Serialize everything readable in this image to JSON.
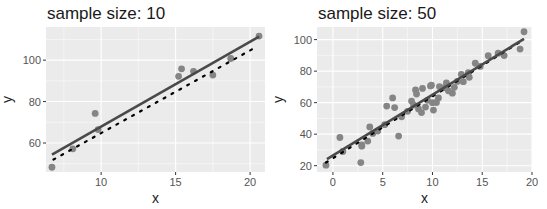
{
  "chart_data": [
    {
      "type": "scatter",
      "title": "sample size: 10",
      "xlabel": "x",
      "ylabel": "y",
      "xlim": [
        6.3,
        21.0
      ],
      "ylim": [
        46,
        116
      ],
      "xticks": [
        10,
        15,
        20
      ],
      "yticks": [
        60,
        80,
        100
      ],
      "grid": true,
      "panel": {
        "x0": 46,
        "x1": 265,
        "y0": 27,
        "y1": 172
      },
      "points": [
        {
          "x": 6.7,
          "y": 48.3
        },
        {
          "x": 8.1,
          "y": 57.2
        },
        {
          "x": 9.6,
          "y": 74.3
        },
        {
          "x": 9.8,
          "y": 66.5
        },
        {
          "x": 15.2,
          "y": 92.2
        },
        {
          "x": 15.4,
          "y": 95.8
        },
        {
          "x": 16.2,
          "y": 94.6
        },
        {
          "x": 17.5,
          "y": 92.8
        },
        {
          "x": 18.7,
          "y": 100.8
        },
        {
          "x": 20.6,
          "y": 111.6
        }
      ],
      "fit_line": {
        "x": [
          6.7,
          20.6
        ],
        "y": [
          54.4,
          111.4
        ]
      },
      "true_line": {
        "x": [
          6.8,
          20.2
        ],
        "y": [
          52.0,
          105.5
        ]
      }
    },
    {
      "type": "scatter",
      "title": "sample size: 50",
      "xlabel": "x",
      "ylabel": "y",
      "xlim": [
        -1.6,
        20.0
      ],
      "ylim": [
        16,
        108
      ],
      "xticks": [
        0,
        5,
        10,
        15,
        20
      ],
      "yticks": [
        20,
        40,
        60,
        80,
        100
      ],
      "grid": true,
      "panel": {
        "x0": 317,
        "x1": 532,
        "y0": 27,
        "y1": 172
      },
      "points": [
        {
          "x": -0.7,
          "y": 20.3
        },
        {
          "x": 0.7,
          "y": 37.9
        },
        {
          "x": 2.8,
          "y": 22.0
        },
        {
          "x": 2.9,
          "y": 33.2
        },
        {
          "x": 2.9,
          "y": 32.4
        },
        {
          "x": 3.5,
          "y": 35.6
        },
        {
          "x": 3.7,
          "y": 44.6
        },
        {
          "x": 4.5,
          "y": 42.0
        },
        {
          "x": 5.4,
          "y": 57.8
        },
        {
          "x": 5.2,
          "y": 46.0
        },
        {
          "x": 6.0,
          "y": 63.0
        },
        {
          "x": 6.2,
          "y": 56.9
        },
        {
          "x": 6.6,
          "y": 38.8
        },
        {
          "x": 7.9,
          "y": 61.0
        },
        {
          "x": 8.3,
          "y": 68.1
        },
        {
          "x": 8.4,
          "y": 65.5
        },
        {
          "x": 8.6,
          "y": 56.0
        },
        {
          "x": 8.9,
          "y": 53.7
        },
        {
          "x": 9.0,
          "y": 69.0
        },
        {
          "x": 9.3,
          "y": 57.2
        },
        {
          "x": 9.8,
          "y": 70.6
        },
        {
          "x": 9.9,
          "y": 71.1
        },
        {
          "x": 10.0,
          "y": 60.0
        },
        {
          "x": 10.1,
          "y": 55.3
        },
        {
          "x": 10.4,
          "y": 60.1
        },
        {
          "x": 10.7,
          "y": 70.2
        },
        {
          "x": 11.1,
          "y": 69.4
        },
        {
          "x": 11.4,
          "y": 72.5
        },
        {
          "x": 12.0,
          "y": 66.0
        },
        {
          "x": 12.2,
          "y": 69.7
        },
        {
          "x": 12.9,
          "y": 78.0
        },
        {
          "x": 13.1,
          "y": 73.3
        },
        {
          "x": 13.6,
          "y": 79.0
        },
        {
          "x": 13.7,
          "y": 76.1
        },
        {
          "x": 14.3,
          "y": 85.0
        },
        {
          "x": 15.6,
          "y": 89.8
        },
        {
          "x": 16.6,
          "y": 91.4
        },
        {
          "x": 17.2,
          "y": 89.9
        },
        {
          "x": 18.8,
          "y": 94.0
        },
        {
          "x": 19.2,
          "y": 105.0
        },
        {
          "x": 7.5,
          "y": 54.5
        },
        {
          "x": 8.1,
          "y": 58.5
        },
        {
          "x": 9.5,
          "y": 61.5
        },
        {
          "x": 10.6,
          "y": 63.0
        },
        {
          "x": 11.6,
          "y": 67.5
        },
        {
          "x": 12.5,
          "y": 73.5
        },
        {
          "x": 4.0,
          "y": 40.5
        },
        {
          "x": 1.0,
          "y": 29.0
        },
        {
          "x": 6.9,
          "y": 51.0
        },
        {
          "x": 14.8,
          "y": 83.0
        }
      ],
      "fit_line": {
        "x": [
          -0.6,
          19.2
        ],
        "y": [
          24.2,
          100.5
        ]
      },
      "true_line": {
        "x": [
          -0.7,
          18.8
        ],
        "y": [
          22.0,
          98.5
        ]
      }
    }
  ],
  "styles": {
    "panel_bg": "#ebebeb",
    "grid_major": "#ffffff",
    "point_color": "#858585",
    "fit_line_color": "#4a4a4a",
    "true_line_color": "#000000",
    "tick_color": "#555555"
  }
}
